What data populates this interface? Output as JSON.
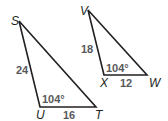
{
  "figure": {
    "colors": {
      "line": "#231f20",
      "measure_text": "#58595b",
      "background": "#ffffff"
    },
    "triangles": [
      {
        "name": "STU",
        "vertices": [
          {
            "label": "S",
            "x": 19,
            "y": 21
          },
          {
            "label": "U",
            "x": 40,
            "y": 107
          },
          {
            "label": "T",
            "x": 96,
            "y": 107
          }
        ],
        "side_labels": [
          {
            "side": "SU",
            "text": "24"
          },
          {
            "side": "UT",
            "text": "16"
          }
        ],
        "angle_label": {
          "vertex": "U",
          "text": "104°"
        }
      },
      {
        "name": "VXW",
        "vertices": [
          {
            "label": "V",
            "x": 88,
            "y": 10
          },
          {
            "label": "X",
            "x": 104,
            "y": 75
          },
          {
            "label": "W",
            "x": 147,
            "y": 75
          }
        ],
        "side_labels": [
          {
            "side": "VX",
            "text": "18"
          },
          {
            "side": "XW",
            "text": "12"
          }
        ],
        "angle_label": {
          "vertex": "X",
          "text": "104°"
        }
      }
    ]
  }
}
